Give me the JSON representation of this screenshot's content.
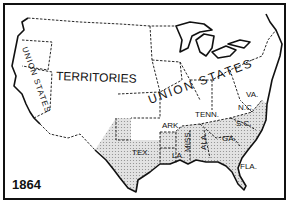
{
  "map": {
    "year": "1864",
    "shade_color": "#d6d6d6",
    "line_color": "#111111",
    "regions": {
      "territories": "TERRITORIES",
      "union_states_main": "UNION STATES",
      "union_states_west": "UNION STATES"
    },
    "confederate_states": [
      "TEX.",
      "ARK.",
      "LA.",
      "MISS.",
      "TENN.",
      "ALA.",
      "GA.",
      "FLA.",
      "S.C.",
      "N.C.",
      "VA."
    ]
  }
}
